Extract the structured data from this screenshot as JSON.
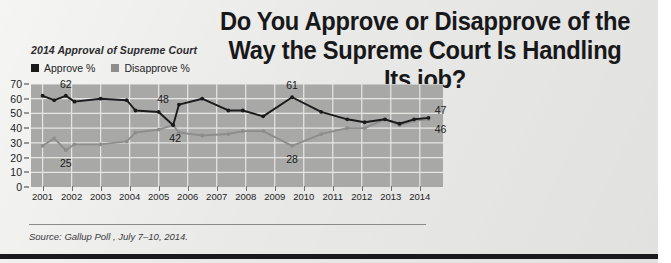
{
  "headline": "Do You Approve or Disapprove of the\nWay the Supreme Court Is Handling\nIts job?",
  "source": {
    "text": "Source: Gallup Poll , July 7–10, 2014."
  },
  "colors": {
    "approve": "#1a1a1c",
    "disapprove": "#8d8d8b",
    "plot_background": "#a8a8a6",
    "page_background": "#e9e9e7",
    "gridline": "#e6e6e4",
    "bottom_bar": "#1a1a1c"
  },
  "chart_data": {
    "type": "line",
    "title": "2014 Approval of Supreme Court",
    "xlabel": "",
    "ylabel": "",
    "ylim": [
      0,
      70
    ],
    "yticks": [
      0,
      10,
      20,
      30,
      40,
      50,
      60,
      70
    ],
    "grid": true,
    "legend_position": "top-left",
    "categories": [
      "2001",
      "2002",
      "2003",
      "2004",
      "2005",
      "2006",
      "2007",
      "2008",
      "2009",
      "2010",
      "2011",
      "2012",
      "2013",
      "2014"
    ],
    "x": [
      2001,
      2002,
      2003,
      2004,
      2005,
      2006,
      2007,
      2008,
      2009,
      2010,
      2011,
      2012,
      2013,
      2014
    ],
    "series": [
      {
        "name": "Approve %",
        "color": "#1a1a1c",
        "points": [
          {
            "x": 2001.0,
            "y": 62
          },
          {
            "x": 2001.4,
            "y": 59
          },
          {
            "x": 2001.8,
            "y": 62
          },
          {
            "x": 2002.1,
            "y": 58
          },
          {
            "x": 2003.0,
            "y": 60
          },
          {
            "x": 2003.9,
            "y": 59
          },
          {
            "x": 2004.2,
            "y": 52
          },
          {
            "x": 2005.0,
            "y": 51
          },
          {
            "x": 2005.5,
            "y": 42
          },
          {
            "x": 2005.7,
            "y": 56
          },
          {
            "x": 2006.5,
            "y": 60
          },
          {
            "x": 2007.4,
            "y": 52
          },
          {
            "x": 2007.9,
            "y": 52
          },
          {
            "x": 2008.6,
            "y": 48
          },
          {
            "x": 2009.6,
            "y": 61
          },
          {
            "x": 2010.6,
            "y": 51
          },
          {
            "x": 2011.5,
            "y": 46
          },
          {
            "x": 2012.1,
            "y": 44
          },
          {
            "x": 2012.8,
            "y": 46
          },
          {
            "x": 2013.3,
            "y": 43
          },
          {
            "x": 2013.8,
            "y": 46
          },
          {
            "x": 2014.3,
            "y": 47
          }
        ]
      },
      {
        "name": "Disapprove %",
        "color": "#8d8d8b",
        "points": [
          {
            "x": 2001.0,
            "y": 28
          },
          {
            "x": 2001.4,
            "y": 33
          },
          {
            "x": 2001.8,
            "y": 25
          },
          {
            "x": 2002.1,
            "y": 29
          },
          {
            "x": 2003.0,
            "y": 29
          },
          {
            "x": 2003.9,
            "y": 31
          },
          {
            "x": 2004.2,
            "y": 37
          },
          {
            "x": 2005.0,
            "y": 39
          },
          {
            "x": 2005.5,
            "y": 42
          },
          {
            "x": 2005.7,
            "y": 37
          },
          {
            "x": 2006.5,
            "y": 35
          },
          {
            "x": 2007.4,
            "y": 36
          },
          {
            "x": 2007.9,
            "y": 38
          },
          {
            "x": 2008.6,
            "y": 38
          },
          {
            "x": 2009.6,
            "y": 28
          },
          {
            "x": 2010.6,
            "y": 36
          },
          {
            "x": 2011.5,
            "y": 40
          },
          {
            "x": 2012.1,
            "y": 40
          },
          {
            "x": 2012.8,
            "y": 46
          },
          {
            "x": 2013.3,
            "y": 42
          },
          {
            "x": 2013.8,
            "y": 45
          },
          {
            "x": 2014.3,
            "y": 46
          }
        ]
      }
    ],
    "annotations": [
      {
        "label": "62",
        "x": 2001.8,
        "y": 62,
        "dx": 0,
        "dy": -12
      },
      {
        "label": "25",
        "x": 2001.8,
        "y": 25,
        "dx": 0,
        "dy": 13
      },
      {
        "label": "48",
        "x": 2005.7,
        "y": 56,
        "dx": -16,
        "dy": -6
      },
      {
        "label": "42",
        "x": 2005.5,
        "y": 42,
        "dx": 2,
        "dy": 13
      },
      {
        "label": "61",
        "x": 2009.6,
        "y": 61,
        "dx": 0,
        "dy": -12
      },
      {
        "label": "28",
        "x": 2009.6,
        "y": 28,
        "dx": 0,
        "dy": 13
      },
      {
        "label": "47",
        "x": 2014.3,
        "y": 47,
        "dx": 12,
        "dy": -8
      },
      {
        "label": "46",
        "x": 2014.3,
        "y": 46,
        "dx": 12,
        "dy": 10
      }
    ]
  }
}
